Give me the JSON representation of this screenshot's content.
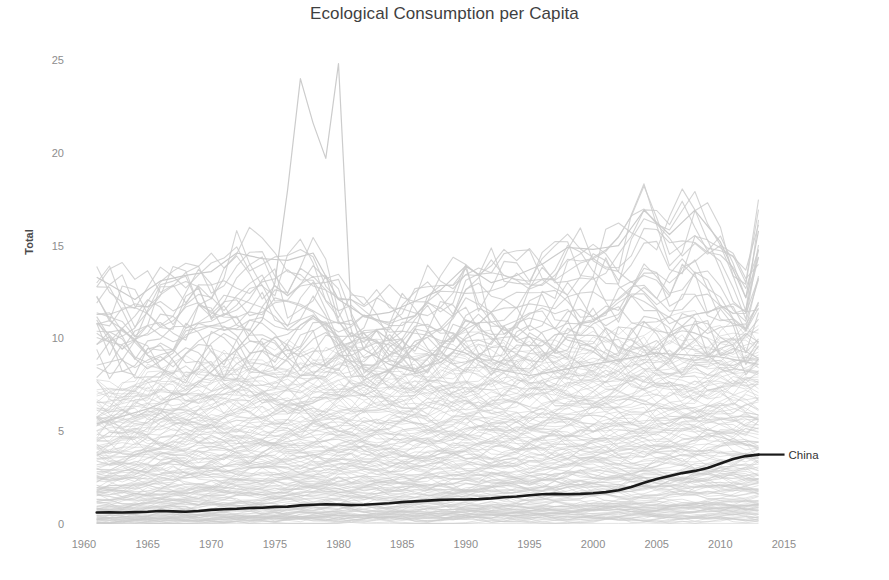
{
  "chart_data": {
    "type": "line",
    "title": "Ecological Consumption per Capita",
    "xlabel": "",
    "ylabel": "Total",
    "xlim": [
      1958.8,
      2016.5
    ],
    "ylim": [
      0,
      26.2
    ],
    "grid": false,
    "legend": "none",
    "xticks": [
      1960,
      1965,
      1970,
      1975,
      1980,
      1985,
      1990,
      1995,
      2000,
      2005,
      2010,
      2015
    ],
    "yticks": [
      0,
      5,
      10,
      15,
      20,
      25
    ],
    "x": [
      1961,
      1962,
      1963,
      1964,
      1965,
      1966,
      1967,
      1968,
      1969,
      1970,
      1971,
      1972,
      1973,
      1974,
      1975,
      1976,
      1977,
      1978,
      1979,
      1980,
      1981,
      1982,
      1983,
      1984,
      1985,
      1986,
      1987,
      1988,
      1989,
      1990,
      1991,
      1992,
      1993,
      1994,
      1995,
      1996,
      1997,
      1998,
      1999,
      2000,
      2001,
      2002,
      2003,
      2004,
      2005,
      2006,
      2007,
      2008,
      2009,
      2010,
      2011,
      2012,
      2013
    ],
    "annotations": [
      {
        "text": "China",
        "x": 2013,
        "y": 3.75,
        "align": "left"
      }
    ],
    "highlight_series": {
      "name": "China",
      "color": "#1a1a1a",
      "width": 2.6,
      "values": [
        0.62,
        0.63,
        0.62,
        0.64,
        0.66,
        0.7,
        0.68,
        0.66,
        0.7,
        0.76,
        0.8,
        0.82,
        0.86,
        0.88,
        0.92,
        0.94,
        1.0,
        1.04,
        1.06,
        1.05,
        1.02,
        1.04,
        1.08,
        1.12,
        1.18,
        1.22,
        1.26,
        1.3,
        1.32,
        1.32,
        1.34,
        1.38,
        1.44,
        1.48,
        1.55,
        1.6,
        1.62,
        1.6,
        1.62,
        1.66,
        1.72,
        1.82,
        2.0,
        2.22,
        2.42,
        2.58,
        2.74,
        2.86,
        3.02,
        3.26,
        3.5,
        3.66,
        3.74
      ]
    },
    "background_series": {
      "name": "All countries",
      "color": "#cccccc",
      "width": 1.0,
      "count": 172,
      "note": "Dense gray band of all country trajectories; bulk lies between 0 and 8, thinning upward to ~17; one outlier spikes to ~24.0 in 1977, dips to ~19.7 in 1979, peaks ~24.8 in 1980, then collapses to ~11 by 1981.",
      "outlier_spike": {
        "label": "peak-outlier",
        "x": [
          1961,
          1965,
          1968,
          1970,
          1972,
          1974,
          1975,
          1976,
          1977,
          1978,
          1979,
          1980,
          1981,
          1982,
          1984,
          1986,
          1988,
          1990,
          1992,
          1995,
          2000,
          2005,
          2010,
          2013
        ],
        "values": [
          5.4,
          6.2,
          7.0,
          8.2,
          9.4,
          11.0,
          13.0,
          18.0,
          24.0,
          21.6,
          19.7,
          24.8,
          11.2,
          9.4,
          8.6,
          8.2,
          9.6,
          9.2,
          8.4,
          8.0,
          8.6,
          9.2,
          9.0,
          8.6
        ]
      },
      "top_envelope": {
        "x": [
          1961,
          1964,
          1966,
          1968,
          1970,
          1972,
          1974,
          1976,
          1978,
          1980,
          1982,
          1984,
          1986,
          1988,
          1990,
          1992,
          1994,
          1996,
          1998,
          2000,
          2002,
          2004,
          2006,
          2008,
          2010,
          2012,
          2013
        ],
        "values": [
          13.3,
          12.1,
          13.1,
          13.4,
          13.6,
          14.6,
          14.3,
          14.2,
          14.6,
          12.1,
          11.2,
          11.4,
          12.0,
          12.6,
          13.9,
          13.0,
          13.4,
          14.0,
          14.9,
          14.8,
          15.0,
          16.9,
          15.6,
          16.9,
          15.2,
          12.2,
          15.8
        ]
      },
      "band_upper": {
        "x": [
          1961,
          1970,
          1980,
          1990,
          2000,
          2010,
          2013
        ],
        "values": [
          7.4,
          8.6,
          9.0,
          9.2,
          9.6,
          10.0,
          9.8
        ]
      },
      "band_lower": {
        "x": [
          1961,
          1970,
          1980,
          1990,
          2000,
          2010,
          2013
        ],
        "values": [
          0.05,
          0.08,
          0.1,
          0.12,
          0.15,
          0.18,
          0.2
        ]
      }
    }
  },
  "axis": {
    "y_title": "Total",
    "y_tick_labels": [
      "0",
      "5",
      "10",
      "15",
      "20",
      "25"
    ],
    "x_tick_labels": [
      "1960",
      "1965",
      "1970",
      "1975",
      "1980",
      "1985",
      "1990",
      "1995",
      "2000",
      "2005",
      "2010",
      "2015"
    ]
  },
  "colors": {
    "background_line": "#cccccc",
    "highlight_line": "#1a1a1a",
    "title_text": "#3f3f3f",
    "tick_text": "#8d8d8d",
    "axis_title_text": "#4a4a4a",
    "page_background": "#ffffff"
  }
}
